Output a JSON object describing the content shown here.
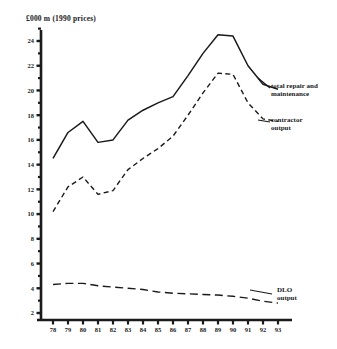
{
  "chart_data": {
    "type": "line",
    "title": "£000 m  (1990 prices)",
    "xlabel": "",
    "ylabel": "",
    "x": [
      "78",
      "79",
      "80",
      "81",
      "82",
      "83",
      "84",
      "85",
      "86",
      "87",
      "88",
      "89",
      "90",
      "91",
      "92",
      "93"
    ],
    "xlim": [
      78,
      93
    ],
    "ylim": [
      1,
      25
    ],
    "yticks": [
      2,
      4,
      6,
      8,
      10,
      12,
      14,
      16,
      18,
      20,
      22,
      24
    ],
    "ytick_labels": [
      "2",
      "4",
      "6",
      "8",
      "10",
      "12",
      "14",
      "16",
      "18",
      "20",
      "22",
      "24"
    ],
    "minor_yticks": [
      3,
      5,
      7,
      9,
      11,
      13,
      15,
      17,
      19,
      21,
      23,
      25
    ],
    "grid": false,
    "legend": "inline-annotations",
    "series": [
      {
        "name": "total repair and maintenance",
        "style": "solid",
        "values": [
          14.5,
          16.6,
          17.5,
          15.8,
          16.0,
          17.6,
          18.4,
          19.0,
          19.5,
          21.2,
          23.0,
          24.5,
          24.4,
          22.0,
          20.5,
          20.1
        ]
      },
      {
        "name": "contractor output",
        "style": "dashed",
        "values": [
          10.2,
          12.2,
          13.0,
          11.6,
          11.9,
          13.6,
          14.5,
          15.3,
          16.3,
          18.0,
          19.8,
          21.4,
          21.3,
          19.0,
          17.7,
          17.5
        ]
      },
      {
        "name": "DLO output",
        "style": "long-dashed",
        "values": [
          4.3,
          4.4,
          4.4,
          4.2,
          4.1,
          4.0,
          3.9,
          3.7,
          3.6,
          3.55,
          3.5,
          3.45,
          3.35,
          3.2,
          2.95,
          2.8
        ]
      }
    ],
    "annotations": [
      {
        "id": "total",
        "text_line1": "total repair and",
        "text_line2": "maintenance"
      },
      {
        "id": "contractor",
        "text_line1": "contractor",
        "text_line2": "output"
      },
      {
        "id": "dlo",
        "text_line1": "DLO",
        "text_line2": "output"
      }
    ]
  },
  "colors": {
    "ink": "#1a1a1a",
    "background": "#ffffff"
  }
}
